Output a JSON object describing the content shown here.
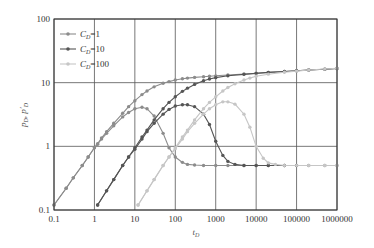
{
  "chart_data": {
    "type": "line",
    "title": "",
    "xlabel": "t_D",
    "ylabel": "p_D, p'_D",
    "xscale": "log",
    "yscale": "log",
    "xlim": [
      0.1,
      1000000
    ],
    "ylim": [
      0.1,
      100
    ],
    "grid": true,
    "legend_position": "upper left",
    "x_ticks": [
      "0.1",
      "1",
      "10",
      "100",
      "1000",
      "10000",
      "100000",
      "1000000"
    ],
    "y_ticks": [
      "0.1",
      "1",
      "10",
      "100"
    ],
    "series": [
      {
        "name": "C_D=1",
        "label_main": "C",
        "label_sub": "D",
        "label_rest": "=1",
        "color": "#8c8c8c",
        "pressure": {
          "x": [
            0.1,
            0.2,
            0.3,
            0.5,
            0.7,
            1,
            1.2,
            1.5,
            2,
            3,
            5,
            7,
            10,
            15,
            20,
            30,
            50,
            70,
            100,
            150,
            200,
            300,
            500,
            700,
            1000,
            2000,
            5000,
            10000,
            20000,
            50000,
            100000,
            200000,
            500000,
            1000000
          ],
          "y": [
            0.12,
            0.22,
            0.32,
            0.5,
            0.68,
            0.95,
            1.1,
            1.35,
            1.7,
            2.3,
            3.3,
            4.2,
            5.2,
            6.5,
            7.4,
            8.6,
            9.8,
            10.4,
            11.0,
            11.5,
            11.8,
            12.1,
            12.4,
            12.6,
            12.8,
            13.2,
            13.7,
            14.1,
            14.5,
            15.0,
            15.4,
            15.8,
            16.3,
            16.7
          ]
        },
        "derivative": {
          "x": [
            0.1,
            0.2,
            0.3,
            0.5,
            0.7,
            1,
            1.2,
            1.5,
            2,
            3,
            5,
            7,
            10,
            15,
            20,
            30,
            50,
            70,
            100,
            150,
            200,
            300,
            500,
            1000,
            2000,
            5000,
            10000,
            20000,
            50000,
            100000,
            200000,
            500000,
            1000000
          ],
          "y": [
            0.12,
            0.22,
            0.32,
            0.5,
            0.68,
            0.95,
            1.08,
            1.3,
            1.6,
            2.1,
            2.9,
            3.4,
            3.9,
            4.1,
            3.9,
            3.0,
            1.6,
            0.95,
            0.68,
            0.56,
            0.52,
            0.51,
            0.5,
            0.5,
            0.5,
            0.5,
            0.5,
            0.5,
            0.5,
            0.5,
            0.5,
            0.5,
            0.5
          ]
        }
      },
      {
        "name": "C_D=10",
        "label_main": "C",
        "label_sub": "D",
        "label_rest": "=10",
        "color": "#555555",
        "pressure": {
          "x": [
            1.2,
            2,
            3,
            5,
            7,
            10,
            15,
            20,
            30,
            50,
            70,
            100,
            150,
            200,
            300,
            500,
            700,
            1000,
            2000,
            5000,
            10000,
            20000,
            50000,
            100000,
            200000,
            500000,
            1000000
          ],
          "y": [
            0.12,
            0.2,
            0.3,
            0.5,
            0.68,
            0.95,
            1.4,
            1.8,
            2.6,
            3.9,
            4.9,
            6.0,
            7.3,
            8.2,
            9.4,
            10.7,
            11.4,
            12.0,
            12.8,
            13.5,
            14.0,
            14.5,
            15.0,
            15.4,
            15.8,
            16.3,
            16.7
          ]
        },
        "derivative": {
          "x": [
            1.2,
            2,
            3,
            5,
            7,
            10,
            15,
            20,
            30,
            50,
            70,
            100,
            150,
            200,
            300,
            500,
            700,
            1000,
            1500,
            2000,
            3000,
            5000,
            10000,
            20000,
            50000,
            100000
          ],
          "y": [
            0.12,
            0.2,
            0.3,
            0.5,
            0.68,
            0.9,
            1.3,
            1.7,
            2.3,
            3.2,
            3.8,
            4.3,
            4.5,
            4.5,
            4.2,
            3.2,
            2.2,
            1.2,
            0.72,
            0.58,
            0.52,
            0.5,
            0.5,
            0.5,
            0.5,
            0.5
          ]
        }
      },
      {
        "name": "C_D=100",
        "label_main": "C",
        "label_sub": "D",
        "label_rest": "=100",
        "color": "#c6c6c6",
        "pressure": {
          "x": [
            12,
            20,
            30,
            50,
            70,
            100,
            150,
            200,
            300,
            500,
            700,
            1000,
            1500,
            2000,
            3000,
            5000,
            7000,
            10000,
            20000,
            50000,
            100000,
            200000,
            500000,
            1000000
          ],
          "y": [
            0.12,
            0.2,
            0.3,
            0.5,
            0.68,
            0.95,
            1.4,
            1.8,
            2.6,
            3.9,
            4.9,
            6.0,
            7.4,
            8.4,
            9.6,
            11.0,
            11.8,
            12.6,
            13.6,
            14.6,
            15.2,
            15.8,
            16.4,
            16.8
          ]
        },
        "derivative": {
          "x": [
            12,
            20,
            30,
            50,
            70,
            100,
            150,
            200,
            300,
            500,
            700,
            1000,
            1500,
            2000,
            3000,
            5000,
            7000,
            10000,
            15000,
            20000,
            30000,
            50000,
            100000,
            200000,
            500000,
            1000000
          ],
          "y": [
            0.12,
            0.2,
            0.3,
            0.5,
            0.68,
            0.92,
            1.3,
            1.7,
            2.3,
            3.2,
            3.9,
            4.5,
            5.0,
            5.0,
            4.6,
            3.2,
            2.0,
            1.0,
            0.65,
            0.55,
            0.52,
            0.5,
            0.5,
            0.5,
            0.5,
            0.5
          ]
        }
      }
    ]
  },
  "layout": {
    "plot_left": 54,
    "plot_top": 19,
    "plot_right": 337,
    "plot_bottom": 210
  }
}
